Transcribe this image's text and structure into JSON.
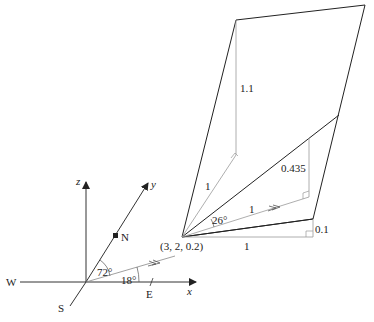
{
  "diagram": {
    "axes": {
      "x": "x",
      "y": "y",
      "z": "z"
    },
    "compass": {
      "north": "N",
      "south": "S",
      "east": "E",
      "west": "W"
    },
    "angles": {
      "from_north": "72°",
      "from_east": "18°",
      "elevation": "26°"
    },
    "point_label": "(3, 2, 0.2)",
    "lengths": {
      "vertical_top": "1.1",
      "slant_left": "1",
      "vertical_mid": "0.435",
      "direction_unit": "1",
      "base": "1",
      "vertical_small": "0.1"
    }
  }
}
